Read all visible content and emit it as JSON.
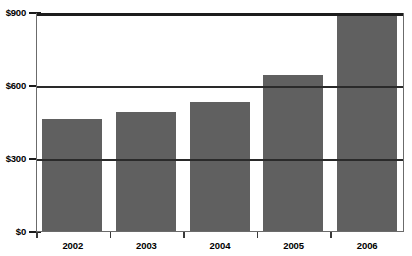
{
  "chart_data": {
    "type": "bar",
    "title": "",
    "subtitle": "",
    "xlabel": "",
    "ylabel": "",
    "categories": [
      "2002",
      "2003",
      "2004",
      "2005",
      "2006"
    ],
    "values": [
      460,
      490,
      530,
      640,
      890
    ],
    "ylim": [
      0,
      900
    ],
    "yticks": [
      0,
      300,
      600,
      900
    ],
    "ytick_labels": [
      "$0",
      "$300",
      "$600",
      "$900"
    ],
    "grid": true,
    "grid_axis": "y",
    "legend": false,
    "legend_position": "none",
    "series": [
      {
        "name": "",
        "values": [
          460,
          490,
          530,
          640,
          890
        ]
      }
    ],
    "colors": {
      "bar_fill": "#606060",
      "gridline": "#1c1c1c",
      "axis": "#6b6b6b",
      "background": "#ffffff",
      "text": "#000000"
    }
  }
}
